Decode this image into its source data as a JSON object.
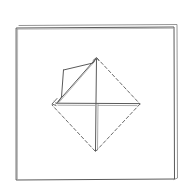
{
  "diagram": {
    "type": "origami-fold-step",
    "background": "#ffffff",
    "stroke_color": "#5a5a5a",
    "stroke_color_light": "#8a8a8a",
    "sheet": {
      "front": {
        "x1": 16,
        "y1": 28,
        "x2": 174,
        "y2": 180
      },
      "back_offset": {
        "top_y": 25,
        "right_x": 177
      }
    },
    "diamond": {
      "top": [
        96,
        58
      ],
      "right": [
        140,
        104
      ],
      "bottom": [
        95,
        152
      ],
      "left": [
        52,
        104
      ],
      "center": [
        95,
        104
      ],
      "edges": [
        {
          "name": "left-top",
          "style": "solid"
        },
        {
          "name": "top-right",
          "style": "dashed"
        },
        {
          "name": "right-bottom",
          "style": "dashed"
        },
        {
          "name": "bottom-left",
          "style": "dashed"
        }
      ]
    },
    "creases": [
      {
        "name": "vertical-center",
        "style": "solid"
      },
      {
        "name": "horizontal-center",
        "style": "solid-double"
      }
    ],
    "flap": {
      "points": [
        [
          63,
          70
        ],
        [
          96,
          58
        ],
        [
          56,
          104
        ],
        [
          60,
          100
        ]
      ]
    }
  }
}
